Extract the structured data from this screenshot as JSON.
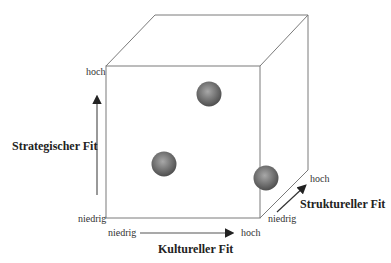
{
  "axes": {
    "y": {
      "title": "Strategischer Fit",
      "low": "niedrig",
      "high": "hoch"
    },
    "x": {
      "title": "Kultureller Fit",
      "low": "niedrig",
      "high": "hoch"
    },
    "z": {
      "title": "Struktureller Fit",
      "low": "niedrig",
      "high": "hoch"
    }
  },
  "spheres": [
    {
      "label": "sphere-top",
      "cx": 209,
      "cy": 94
    },
    {
      "label": "sphere-mid-left",
      "cx": 164,
      "cy": 163
    },
    {
      "label": "sphere-right-edge",
      "cx": 265,
      "cy": 178
    }
  ],
  "colors": {
    "line": "#7a7a7a",
    "sphere_dark": "#505050",
    "sphere_light": "#a8a8a8",
    "text": "#222222"
  }
}
